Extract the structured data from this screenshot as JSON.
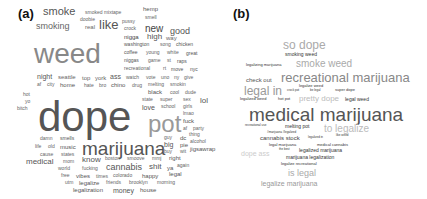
{
  "panels": [
    {
      "label": "(a)",
      "words": [
        {
          "t": "smoke",
          "x": 43,
          "y": 6,
          "s": 11,
          "c": "#555"
        },
        {
          "t": "smoked mixtape",
          "x": 85,
          "y": 10,
          "s": 5,
          "c": "#666"
        },
        {
          "t": "hemp",
          "x": 143,
          "y": 6,
          "s": 6,
          "c": "#555"
        },
        {
          "t": "smell",
          "x": 145,
          "y": 15,
          "s": 5,
          "c": "#666"
        },
        {
          "t": "smoking",
          "x": 36,
          "y": 22,
          "s": 9,
          "c": "#666"
        },
        {
          "t": "doobie",
          "x": 80,
          "y": 17,
          "s": 5,
          "c": "#666"
        },
        {
          "t": "real",
          "x": 85,
          "y": 24,
          "s": 6,
          "c": "#666"
        },
        {
          "t": "like",
          "x": 99,
          "y": 18,
          "s": 13,
          "c": "#555"
        },
        {
          "t": "pussy",
          "x": 122,
          "y": 19,
          "s": 5,
          "c": "#666"
        },
        {
          "t": "crock",
          "x": 124,
          "y": 26,
          "s": 5,
          "c": "#666"
        },
        {
          "t": "new",
          "x": 145,
          "y": 24,
          "s": 10,
          "c": "#444"
        },
        {
          "t": "good",
          "x": 170,
          "y": 27,
          "s": 9,
          "c": "#555"
        },
        {
          "t": "nigga",
          "x": 124,
          "y": 34,
          "s": 6,
          "c": "#444"
        },
        {
          "t": "high",
          "x": 147,
          "y": 33,
          "s": 8,
          "c": "#555"
        },
        {
          "t": "way",
          "x": 166,
          "y": 35,
          "s": 6,
          "c": "#666"
        },
        {
          "t": "washington",
          "x": 124,
          "y": 42,
          "s": 5,
          "c": "#555"
        },
        {
          "t": "song",
          "x": 160,
          "y": 42,
          "s": 5,
          "c": "#666"
        },
        {
          "t": "chicken",
          "x": 176,
          "y": 42,
          "s": 5,
          "c": "#555"
        },
        {
          "t": "weed",
          "x": 34,
          "y": 40,
          "s": 28,
          "c": "#888"
        },
        {
          "t": "coffee",
          "x": 124,
          "y": 50,
          "s": 5,
          "c": "#555"
        },
        {
          "t": "young",
          "x": 146,
          "y": 50,
          "s": 5,
          "c": "#666"
        },
        {
          "t": "white",
          "x": 167,
          "y": 50,
          "s": 5,
          "c": "#666"
        },
        {
          "t": "great",
          "x": 186,
          "y": 51,
          "s": 5,
          "c": "#555"
        },
        {
          "t": "niggas",
          "x": 124,
          "y": 58,
          "s": 5,
          "c": "#555"
        },
        {
          "t": "game",
          "x": 148,
          "y": 58,
          "s": 5,
          "c": "#666"
        },
        {
          "t": "st",
          "x": 167,
          "y": 58,
          "s": 5,
          "c": "#666"
        },
        {
          "t": "raps",
          "x": 177,
          "y": 59,
          "s": 5,
          "c": "#555"
        },
        {
          "t": "recreational",
          "x": 124,
          "y": 66,
          "s": 5,
          "c": "#666"
        },
        {
          "t": "rt",
          "x": 163,
          "y": 66,
          "s": 5,
          "c": "#666"
        },
        {
          "t": "move",
          "x": 171,
          "y": 67,
          "s": 5,
          "c": "#555"
        },
        {
          "t": "nyc",
          "x": 190,
          "y": 67,
          "s": 5,
          "c": "#555"
        },
        {
          "t": "night",
          "x": 37,
          "y": 73,
          "s": 7,
          "c": "#555"
        },
        {
          "t": "seattle",
          "x": 58,
          "y": 74,
          "s": 6,
          "c": "#666"
        },
        {
          "t": "top",
          "x": 82,
          "y": 75,
          "s": 6,
          "c": "#666"
        },
        {
          "t": "york",
          "x": 95,
          "y": 75,
          "s": 6,
          "c": "#666"
        },
        {
          "t": "ass",
          "x": 110,
          "y": 73,
          "s": 7,
          "c": "#555"
        },
        {
          "t": "watch",
          "x": 126,
          "y": 75,
          "s": 5,
          "c": "#666"
        },
        {
          "t": "vote",
          "x": 146,
          "y": 75,
          "s": 5,
          "c": "#666"
        },
        {
          "t": "uno",
          "x": 161,
          "y": 75,
          "s": 5,
          "c": "#666"
        },
        {
          "t": "ny",
          "x": 174,
          "y": 75,
          "s": 5,
          "c": "#666"
        },
        {
          "t": "give",
          "x": 184,
          "y": 75,
          "s": 5,
          "c": "#666"
        },
        {
          "t": "af",
          "x": 37,
          "y": 82,
          "s": 5,
          "c": "#666"
        },
        {
          "t": "city",
          "x": 47,
          "y": 82,
          "s": 5,
          "c": "#666"
        },
        {
          "t": "home",
          "x": 60,
          "y": 82,
          "s": 6,
          "c": "#555"
        },
        {
          "t": "hate",
          "x": 84,
          "y": 83,
          "s": 5,
          "c": "#666"
        },
        {
          "t": "bro",
          "x": 99,
          "y": 83,
          "s": 5,
          "c": "#666"
        },
        {
          "t": "chino",
          "x": 111,
          "y": 82,
          "s": 6,
          "c": "#555"
        },
        {
          "t": "drug",
          "x": 132,
          "y": 83,
          "s": 5,
          "c": "#666"
        },
        {
          "t": "melting",
          "x": 148,
          "y": 82,
          "s": 5,
          "c": "#666"
        },
        {
          "t": "smokin",
          "x": 170,
          "y": 82,
          "s": 5,
          "c": "#666"
        },
        {
          "t": "black",
          "x": 148,
          "y": 89,
          "s": 6,
          "c": "#555"
        },
        {
          "t": "cool",
          "x": 170,
          "y": 90,
          "s": 5,
          "c": "#666"
        },
        {
          "t": "dude",
          "x": 185,
          "y": 90,
          "s": 5,
          "c": "#666"
        },
        {
          "t": "hot",
          "x": 23,
          "y": 92,
          "s": 5,
          "c": "#666"
        },
        {
          "t": "yo",
          "x": 25,
          "y": 99,
          "s": 5,
          "c": "#666"
        },
        {
          "t": "bitch",
          "x": 17,
          "y": 106,
          "s": 5,
          "c": "#666"
        },
        {
          "t": "state",
          "x": 142,
          "y": 97,
          "s": 5,
          "c": "#666"
        },
        {
          "t": "super",
          "x": 160,
          "y": 97,
          "s": 5,
          "c": "#666"
        },
        {
          "t": "sex",
          "x": 183,
          "y": 97,
          "s": 5,
          "c": "#666"
        },
        {
          "t": "lol",
          "x": 200,
          "y": 97,
          "s": 8,
          "c": "#555"
        },
        {
          "t": "love",
          "x": 142,
          "y": 104,
          "s": 7,
          "c": "#555"
        },
        {
          "t": "school",
          "x": 161,
          "y": 104,
          "s": 5,
          "c": "#666"
        },
        {
          "t": "girls",
          "x": 183,
          "y": 104,
          "s": 5,
          "c": "#666"
        },
        {
          "t": "dope",
          "x": 38,
          "y": 96,
          "s": 42,
          "c": "#555"
        },
        {
          "t": "lmao",
          "x": 183,
          "y": 111,
          "s": 5,
          "c": "#666"
        },
        {
          "t": "fuck",
          "x": 183,
          "y": 118,
          "s": 6,
          "c": "#555"
        },
        {
          "t": "pot",
          "x": 148,
          "y": 112,
          "s": 24,
          "c": "#999"
        },
        {
          "t": "af",
          "x": 183,
          "y": 126,
          "s": 5,
          "c": "#666"
        },
        {
          "t": "party",
          "x": 193,
          "y": 126,
          "s": 5,
          "c": "#666"
        },
        {
          "t": "thing",
          "x": 189,
          "y": 132,
          "s": 5,
          "c": "#666"
        },
        {
          "t": "guy",
          "x": 164,
          "y": 135,
          "s": 5,
          "c": "#666"
        },
        {
          "t": "dc",
          "x": 180,
          "y": 135,
          "s": 6,
          "c": "#555"
        },
        {
          "t": "alcohol",
          "x": 190,
          "y": 139,
          "s": 5,
          "c": "#666"
        },
        {
          "t": "damn",
          "x": 40,
          "y": 136,
          "s": 5,
          "c": "#666"
        },
        {
          "t": "smells",
          "x": 60,
          "y": 136,
          "s": 5,
          "c": "#555"
        },
        {
          "t": "big",
          "x": 164,
          "y": 141,
          "s": 7,
          "c": "#555"
        },
        {
          "t": "pie",
          "x": 180,
          "y": 142,
          "s": 6,
          "c": "#555"
        },
        {
          "t": "life",
          "x": 35,
          "y": 144,
          "s": 5,
          "c": "#666"
        },
        {
          "t": "old",
          "x": 48,
          "y": 144,
          "s": 5,
          "c": "#666"
        },
        {
          "t": "music",
          "x": 60,
          "y": 144,
          "s": 6,
          "c": "#555"
        },
        {
          "t": "marijuana",
          "x": 82,
          "y": 139,
          "s": 19,
          "c": "#555"
        },
        {
          "t": "buy",
          "x": 164,
          "y": 149,
          "s": 5,
          "c": "#666"
        },
        {
          "t": "wit",
          "x": 180,
          "y": 149,
          "s": 5,
          "c": "#666"
        },
        {
          "t": "jigsawrap",
          "x": 190,
          "y": 146,
          "s": 6,
          "c": "#555"
        },
        {
          "t": "cause",
          "x": 40,
          "y": 152,
          "s": 5,
          "c": "#666"
        },
        {
          "t": "states",
          "x": 61,
          "y": 152,
          "s": 5,
          "c": "#666"
        },
        {
          "t": "medical",
          "x": 26,
          "y": 158,
          "s": 8,
          "c": "#555"
        },
        {
          "t": "mom",
          "x": 63,
          "y": 159,
          "s": 5,
          "c": "#666"
        },
        {
          "t": "know",
          "x": 82,
          "y": 156,
          "s": 8,
          "c": "#555"
        },
        {
          "t": "boston",
          "x": 105,
          "y": 156,
          "s": 5,
          "c": "#666"
        },
        {
          "t": "smoove",
          "x": 127,
          "y": 156,
          "s": 5,
          "c": "#666"
        },
        {
          "t": "mmj",
          "x": 152,
          "y": 156,
          "s": 5,
          "c": "#666"
        },
        {
          "t": "right",
          "x": 169,
          "y": 155,
          "s": 6,
          "c": "#555"
        },
        {
          "t": "world",
          "x": 58,
          "y": 166,
          "s": 5,
          "c": "#666"
        },
        {
          "t": "fucking",
          "x": 82,
          "y": 166,
          "s": 5,
          "c": "#666"
        },
        {
          "t": "cannabis",
          "x": 106,
          "y": 163,
          "s": 9,
          "c": "#555"
        },
        {
          "t": "shit",
          "x": 149,
          "y": 163,
          "s": 8,
          "c": "#555"
        },
        {
          "t": "ya",
          "x": 167,
          "y": 165,
          "s": 6,
          "c": "#555"
        },
        {
          "t": "again",
          "x": 177,
          "y": 163,
          "s": 5,
          "c": "#666"
        },
        {
          "t": "legal",
          "x": 169,
          "y": 171,
          "s": 6,
          "c": "#555"
        },
        {
          "t": "free",
          "x": 61,
          "y": 173,
          "s": 5,
          "c": "#666"
        },
        {
          "t": "vibes",
          "x": 76,
          "y": 173,
          "s": 6,
          "c": "#555"
        },
        {
          "t": "times",
          "x": 96,
          "y": 174,
          "s": 5,
          "c": "#666"
        },
        {
          "t": "colorado",
          "x": 113,
          "y": 173,
          "s": 5,
          "c": "#666"
        },
        {
          "t": "happy",
          "x": 142,
          "y": 173,
          "s": 6,
          "c": "#555"
        },
        {
          "t": "utm",
          "x": 65,
          "y": 180,
          "s": 5,
          "c": "#666"
        },
        {
          "t": "legalize",
          "x": 79,
          "y": 180,
          "s": 6,
          "c": "#555"
        },
        {
          "t": "friends",
          "x": 106,
          "y": 180,
          "s": 5,
          "c": "#666"
        },
        {
          "t": "brooklyn",
          "x": 129,
          "y": 180,
          "s": 5,
          "c": "#666"
        },
        {
          "t": "morning",
          "x": 157,
          "y": 180,
          "s": 5,
          "c": "#666"
        },
        {
          "t": "legalization",
          "x": 73,
          "y": 187,
          "s": 6,
          "c": "#555"
        },
        {
          "t": "money",
          "x": 113,
          "y": 187,
          "s": 7,
          "c": "#555"
        },
        {
          "t": "house",
          "x": 140,
          "y": 187,
          "s": 6,
          "c": "#555"
        }
      ]
    },
    {
      "label": "(b)",
      "words": [
        {
          "t": "so dope",
          "x": 63,
          "y": 39,
          "s": 12,
          "c": "#aaa"
        },
        {
          "t": "smoking weed",
          "x": 65,
          "y": 52,
          "s": 5,
          "c": "#333"
        },
        {
          "t": "legalizing marijuana",
          "x": 26,
          "y": 63,
          "s": 4,
          "c": "#333"
        },
        {
          "t": "smoke weed",
          "x": 76,
          "y": 59,
          "s": 10,
          "c": "#aaa"
        },
        {
          "t": "check out",
          "x": 26,
          "y": 77,
          "s": 6,
          "c": "#555"
        },
        {
          "t": "recreational marijuana",
          "x": 61,
          "y": 71,
          "s": 13,
          "c": "#888"
        },
        {
          "t": "legalize weed",
          "x": 79,
          "y": 84,
          "s": 4,
          "c": "#333"
        },
        {
          "t": "legal in",
          "x": 24,
          "y": 85,
          "s": 12,
          "c": "#999"
        },
        {
          "t": "crock pot",
          "x": 67,
          "y": 89,
          "s": 3,
          "c": "#333"
        },
        {
          "t": "be legal",
          "x": 90,
          "y": 89,
          "s": 3,
          "c": "#333"
        },
        {
          "t": "super dope",
          "x": 115,
          "y": 88,
          "s": 4,
          "c": "#333"
        },
        {
          "t": "legalized weed",
          "x": 20,
          "y": 97,
          "s": 4,
          "c": "#333"
        },
        {
          "t": "hot pot",
          "x": 58,
          "y": 97,
          "s": 4,
          "c": "#333"
        },
        {
          "t": "pretty dope",
          "x": 79,
          "y": 95,
          "s": 8,
          "c": "#bbb"
        },
        {
          "t": "legal weed",
          "x": 125,
          "y": 97,
          "s": 5,
          "c": "#333"
        },
        {
          "t": "medical marijuana",
          "x": 29,
          "y": 105,
          "s": 19,
          "c": "#555"
        },
        {
          "t": "recreational use",
          "x": 25,
          "y": 124,
          "s": 3,
          "c": "#333"
        },
        {
          "t": "melting pot",
          "x": 65,
          "y": 124,
          "s": 5,
          "c": "#333"
        },
        {
          "t": "to legalize",
          "x": 104,
          "y": 124,
          "s": 10,
          "c": "#bbb"
        },
        {
          "t": "#marijuana #legalized",
          "x": 47,
          "y": 131,
          "s": 3,
          "c": "#333"
        },
        {
          "t": "cannabis stock",
          "x": 40,
          "y": 135,
          "s": 6,
          "c": "#444"
        },
        {
          "t": "legalized in",
          "x": 88,
          "y": 136,
          "s": 3,
          "c": "#333"
        },
        {
          "t": "like weed",
          "x": 116,
          "y": 134,
          "s": 3,
          "c": "#333"
        },
        {
          "t": "legal marijuana",
          "x": 49,
          "y": 143,
          "s": 4,
          "c": "#333"
        },
        {
          "t": "medical cannabis",
          "x": 97,
          "y": 143,
          "s": 4,
          "c": "#333"
        },
        {
          "t": "dope ass",
          "x": 21,
          "y": 150,
          "s": 7,
          "c": "#ccc"
        },
        {
          "t": "the best",
          "x": 59,
          "y": 148,
          "s": 3,
          "c": "#333"
        },
        {
          "t": "legalized marijuana",
          "x": 79,
          "y": 148,
          "s": 5,
          "c": "#333"
        },
        {
          "t": "marijuana legalization",
          "x": 66,
          "y": 155,
          "s": 5,
          "c": "#333"
        },
        {
          "t": "legalize recreational",
          "x": 61,
          "y": 162,
          "s": 4,
          "c": "#333"
        },
        {
          "t": "is legal",
          "x": 68,
          "y": 169,
          "s": 9,
          "c": "#aaa"
        },
        {
          "t": "legalize marijuana",
          "x": 41,
          "y": 180,
          "s": 7,
          "c": "#999"
        }
      ]
    }
  ]
}
